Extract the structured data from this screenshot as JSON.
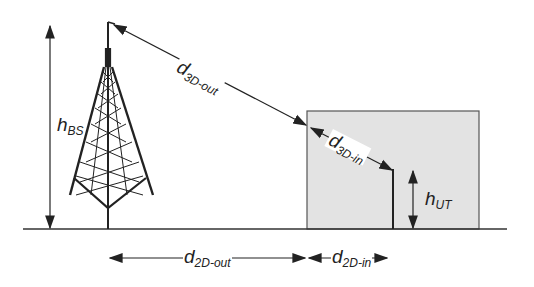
{
  "diagram": {
    "type": "3D distance geometry (base station to indoor user terminal)",
    "colors": {
      "line": "#2a2a2a",
      "building_fill": "#e3e3e3",
      "building_border": "#555555",
      "background": "#ffffff"
    },
    "labels": {
      "h_bs": {
        "main": "h",
        "sub": "BS"
      },
      "d_3d_out": {
        "main": "d",
        "sub": "3D-out"
      },
      "d_3d_in": {
        "main": "d",
        "sub": "3D-in"
      },
      "h_ut": {
        "main": "h",
        "sub": "UT"
      },
      "d_2d_out": {
        "main": "d",
        "sub": "2D-out"
      },
      "d_2d_in": {
        "main": "d",
        "sub": "2D-in"
      }
    },
    "elements": [
      "base-station-tower",
      "building",
      "user-terminal",
      "ground-line"
    ]
  }
}
